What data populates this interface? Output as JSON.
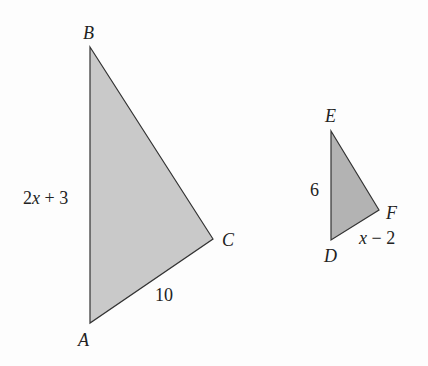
{
  "diagram": {
    "type": "similar-triangles",
    "colors": {
      "large_fill": "#c9c9c9",
      "small_fill": "#b3b3b3",
      "stroke": "#333333",
      "background": "#fdfdfd"
    },
    "triangle_abc": {
      "vertices": {
        "A": {
          "label": "A",
          "x": 90,
          "y": 323
        },
        "B": {
          "label": "B",
          "x": 90,
          "y": 47
        },
        "C": {
          "label": "C",
          "x": 213,
          "y": 239
        }
      },
      "sides": {
        "AB": "2x + 3",
        "AC": "10"
      }
    },
    "triangle_def": {
      "vertices": {
        "D": {
          "label": "D",
          "x": 331,
          "y": 240
        },
        "E": {
          "label": "E",
          "x": 331,
          "y": 131
        },
        "F": {
          "label": "F",
          "x": 379,
          "y": 210
        }
      },
      "sides": {
        "DE": "6",
        "DF": "x − 2"
      }
    }
  }
}
